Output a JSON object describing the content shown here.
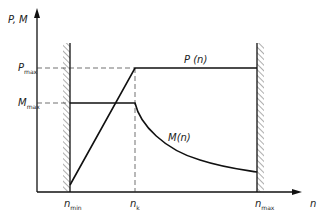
{
  "diagram": {
    "type": "line",
    "y_axis_label": "P, M",
    "x_axis_label": "n",
    "y_ticks": [
      {
        "main": "P",
        "sub": "max"
      },
      {
        "main": "M",
        "sub": "max"
      }
    ],
    "x_ticks": [
      {
        "main": "n",
        "sub": "min"
      },
      {
        "main": "n",
        "sub": "k"
      },
      {
        "main": "n",
        "sub": "max"
      }
    ],
    "curves": [
      {
        "name": "P(n)",
        "label": "P (n)",
        "description": "rises linearly from n_min to P_max at n_k, then constant until n_max"
      },
      {
        "name": "M(n)",
        "label": "M(n)",
        "description": "constant at M_max from n_min to n_k, then decreasing hyperbolically to n_max"
      }
    ],
    "boundaries": [
      "n_min",
      "n_max"
    ]
  }
}
